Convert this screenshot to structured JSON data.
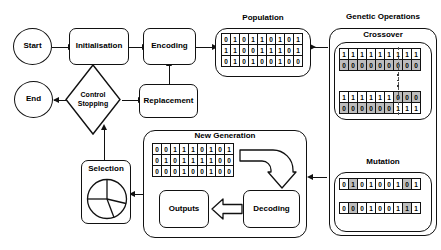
{
  "diagram": {
    "nodes": {
      "start": "Start",
      "initialisation": "Initialisation",
      "encoding": "Encoding",
      "end": "End",
      "control_stopping": "Control\nStopping",
      "replacement": "Replacement",
      "selection": "Selection",
      "decoding": "Decoding",
      "outputs": "Outputs"
    },
    "groups": {
      "population": "Population",
      "genetic_operations": "Genetic Operations",
      "crossover": "Crossover",
      "mutation": "Mutation",
      "new_generation": "New Generation"
    },
    "matrices": {
      "population": {
        "label": "Population",
        "rows": [
          {
            "bits": [
              "0",
              "1",
              "0",
              "1",
              "1",
              "0",
              "1",
              "0",
              "1"
            ],
            "shaded": []
          },
          {
            "bits": [
              "1",
              "1",
              "0",
              "0",
              "1",
              "1",
              "1",
              "0",
              "1"
            ],
            "shaded": []
          },
          {
            "bits": [
              "0",
              "1",
              "0",
              "1",
              "0",
              "0",
              "1",
              "0",
              "0"
            ],
            "shaded": []
          }
        ]
      },
      "crossover_parents": {
        "label": "Crossover parents",
        "rows": [
          {
            "bits": [
              "1",
              "1",
              "1",
              "1",
              "1",
              "1",
              "1",
              "1",
              "1"
            ],
            "shaded": []
          },
          {
            "bits": [
              "0",
              "0",
              "0",
              "0",
              "0",
              "0",
              "0",
              "0",
              "0"
            ],
            "shaded": [
              0,
              1,
              2,
              3,
              4,
              5,
              6,
              7,
              8
            ]
          }
        ]
      },
      "crossover_offspring": {
        "label": "Crossover offspring",
        "rows": [
          {
            "bits": [
              "1",
              "1",
              "1",
              "1",
              "1",
              "1",
              "0",
              "0",
              "0"
            ],
            "shaded": [
              6,
              7,
              8
            ]
          },
          {
            "bits": [
              "0",
              "0",
              "0",
              "0",
              "0",
              "0",
              "1",
              "1",
              "1"
            ],
            "shaded": [
              0,
              1,
              2,
              3,
              4,
              5
            ]
          }
        ]
      },
      "mutation": {
        "label": "Mutation",
        "rows": [
          {
            "bits": [
              "0",
              "1",
              "0",
              "1",
              "0",
              "0",
              "1",
              "0",
              "1"
            ],
            "shaded": [
              1,
              7
            ]
          },
          {
            "bits": [
              "0",
              "0",
              "0",
              "1",
              "0",
              "0",
              "1",
              "1",
              "1"
            ],
            "shaded": [
              1,
              7
            ]
          }
        ]
      },
      "new_generation": {
        "label": "New Generation",
        "rows": [
          {
            "bits": [
              "0",
              "0",
              "1",
              "1",
              "1",
              "0",
              "1",
              "0",
              "1"
            ],
            "shaded": []
          },
          {
            "bits": [
              "0",
              "1",
              "0",
              "1",
              "1",
              "1",
              "1",
              "0",
              "0"
            ],
            "shaded": []
          },
          {
            "bits": [
              "0",
              "0",
              "0",
              "1",
              "0",
              "0",
              "1",
              "0",
              "0"
            ],
            "shaded": []
          }
        ]
      }
    },
    "colors": {
      "stroke": "#111111",
      "background": "#ffffff",
      "shaded_cell": "#bdbdbd",
      "crossover_point": "#555555"
    }
  }
}
